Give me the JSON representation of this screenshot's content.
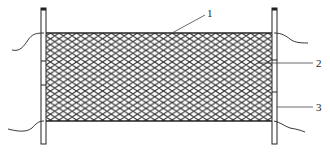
{
  "diagram": {
    "type": "technical-drawing",
    "colors": {
      "background": "#ffffff",
      "line": "#222222",
      "mesh": "#333333"
    },
    "labels": [
      {
        "id": "1",
        "text": "1",
        "target": "top-edge-rope"
      },
      {
        "id": "2",
        "text": "2",
        "target": "mesh-net"
      },
      {
        "id": "3",
        "text": "3",
        "target": "side-pole"
      }
    ]
  }
}
